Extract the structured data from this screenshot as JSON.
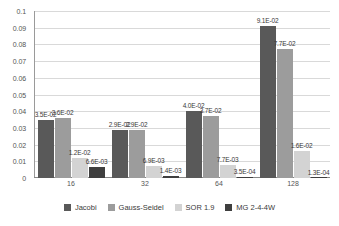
{
  "chart_data": {
    "type": "bar",
    "title": "",
    "subtitle": "",
    "xlabel": "",
    "ylabel": "",
    "categories": [
      "16",
      "32",
      "64",
      "128"
    ],
    "ylim": [
      0,
      0.1
    ],
    "y_ticks": [
      "0",
      "0.01",
      "0.02",
      "0.03",
      "0.04",
      "0.05",
      "0.06",
      "0.07",
      "0.08",
      "0.09",
      "0.1"
    ],
    "y_tick_values": [
      0,
      0.01,
      0.02,
      0.03,
      0.04,
      0.05,
      0.06,
      0.07,
      0.08,
      0.09,
      0.1
    ],
    "grid": true,
    "legend_position": "bottom",
    "series": [
      {
        "name": "Jacobi",
        "color": "#595959",
        "values": [
          0.035,
          0.029,
          0.04,
          0.091
        ],
        "labels": [
          "3.5E-02",
          "2.9E-02",
          "4.0E-02",
          "9.1E-02"
        ]
      },
      {
        "name": "Gauss-Seidel",
        "color": "#9c9c9c",
        "values": [
          0.036,
          0.029,
          0.037,
          0.077
        ],
        "labels": [
          "3.6E-02",
          "2.9E-02",
          "3.7E-02",
          "7.7E-02"
        ]
      },
      {
        "name": "SOR 1.9",
        "color": "#d3d3d3",
        "values": [
          0.012,
          0.0069,
          0.0077,
          0.016
        ],
        "labels": [
          "1.2E-02",
          "6.9E-03",
          "7.7E-03",
          "1.6E-02"
        ]
      },
      {
        "name": "MG 2-4-4W",
        "color": "#3f3f3f",
        "values": [
          0.0066,
          0.0014,
          0.00035,
          0.00013
        ],
        "labels": [
          "6.6E-03",
          "1.4E-03",
          "3.5E-04",
          "1.3E-04"
        ]
      }
    ]
  },
  "legend": {
    "items": [
      {
        "label": "Jacobi",
        "color": "#595959"
      },
      {
        "label": "Gauss-Seidel",
        "color": "#9c9c9c"
      },
      {
        "label": "SOR 1.9",
        "color": "#d3d3d3"
      },
      {
        "label": "MG 2-4-4W",
        "color": "#3f3f3f"
      }
    ]
  }
}
